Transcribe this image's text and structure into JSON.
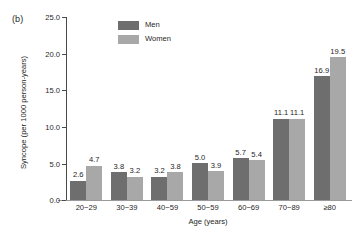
{
  "panel": {
    "label": "(b)"
  },
  "legend": {
    "position": "top-left-inside",
    "entries": [
      {
        "name": "Men",
        "color": "#6e6e6e"
      },
      {
        "name": "Women",
        "color": "#a8a8a8"
      }
    ]
  },
  "axes": {
    "y_ticks": [
      "0.0",
      "5.0",
      "10.0",
      "15.0",
      "20.0",
      "25.0"
    ],
    "x_label": "Age (years)",
    "y_label": "Syncope (per 1000 person-years)"
  },
  "chart_data": {
    "type": "bar",
    "title": "",
    "subtitle": "",
    "xlabel": "Age (years)",
    "ylabel": "Syncope (per 1000 person-years)",
    "categories": [
      "20−29",
      "30−39",
      "40−59",
      "50−59",
      "60−69",
      "70−89",
      "≥80"
    ],
    "series": [
      {
        "name": "Men",
        "color": "#6e6e6e",
        "values": [
          2.6,
          3.8,
          3.2,
          5.0,
          5.7,
          11.1,
          16.9
        ]
      },
      {
        "name": "Women",
        "color": "#a8a8a8",
        "values": [
          4.7,
          3.2,
          3.8,
          3.9,
          5.4,
          11.1,
          19.5
        ]
      }
    ],
    "data_labels": {
      "Men": [
        "2.6",
        "3.8",
        "3.2",
        "5.0",
        "5.7",
        "11.1",
        "16.9"
      ],
      "Women": [
        "4.7",
        "3.2",
        "3.8",
        "3.9",
        "5.4",
        "11.1",
        "19.5"
      ]
    },
    "ylim": [
      0,
      25
    ],
    "yticks": [
      0,
      5,
      10,
      15,
      20,
      25
    ],
    "ytick_labels": [
      "0.0",
      "5.0",
      "10.0",
      "15.0",
      "20.0",
      "25.0"
    ],
    "grid": false,
    "legend_position": "upper left"
  }
}
